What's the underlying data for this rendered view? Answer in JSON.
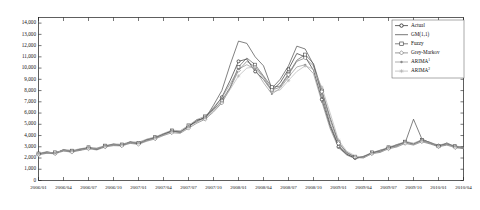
{
  "chart_data": {
    "type": "line",
    "title": "",
    "xlabel": "",
    "ylabel": "",
    "ylim": [
      0,
      14500
    ],
    "yticks": [
      0,
      1000,
      2000,
      3000,
      4000,
      5000,
      6000,
      7000,
      8000,
      9000,
      10000,
      11000,
      12000,
      13000,
      14000
    ],
    "ytick_labels": [
      "0",
      "1,000",
      "2,000",
      "3,000",
      "4,000",
      "5,000",
      "6,000",
      "7,000",
      "8,000",
      "9,000",
      "10,000",
      "11,000",
      "12,000",
      "13,000",
      "14,000"
    ],
    "grid": false,
    "legend_position": "top-right",
    "x_tick_labels": [
      "2006/01",
      "2006/04",
      "2006/07",
      "2006/10",
      "2007/01",
      "2007/04",
      "2007/07",
      "2007/10",
      "2008/01",
      "2008/04",
      "2008/07",
      "2008/10",
      "2009/01",
      "2009/04",
      "2009/07",
      "2009/10",
      "2010/01",
      "2010/04"
    ],
    "x_months": [
      "2006/01",
      "2006/02",
      "2006/03",
      "2006/04",
      "2006/05",
      "2006/06",
      "2006/07",
      "2006/08",
      "2006/09",
      "2006/10",
      "2006/11",
      "2006/12",
      "2007/01",
      "2007/02",
      "2007/03",
      "2007/04",
      "2007/05",
      "2007/06",
      "2007/07",
      "2007/08",
      "2007/09",
      "2007/10",
      "2007/11",
      "2007/12",
      "2008/01",
      "2008/02",
      "2008/03",
      "2008/04",
      "2008/05",
      "2008/06",
      "2008/07",
      "2008/08",
      "2008/09",
      "2008/10",
      "2008/11",
      "2008/12",
      "2009/01",
      "2009/02",
      "2009/03",
      "2009/04",
      "2009/05",
      "2009/06",
      "2009/07",
      "2009/08",
      "2009/09",
      "2009/10",
      "2009/11",
      "2009/12",
      "2010/01",
      "2010/02",
      "2010/03",
      "2010/04"
    ],
    "series": [
      {
        "name": "Actual",
        "color": "#222222",
        "marker": "circle-filled",
        "values": [
          2350,
          2500,
          2450,
          2700,
          2600,
          2750,
          2900,
          2800,
          3050,
          3200,
          3150,
          3400,
          3300,
          3600,
          3800,
          4100,
          4400,
          4300,
          4800,
          5300,
          5600,
          6400,
          7400,
          8900,
          10600,
          10800,
          9700,
          9000,
          8000,
          8700,
          9900,
          11300,
          11000,
          9800,
          7200,
          4800,
          3000,
          2300,
          2000,
          2100,
          2450,
          2600,
          2900,
          3100,
          3400,
          3250,
          3550,
          3300,
          3100,
          3250,
          3000,
          2900
        ]
      },
      {
        "name": "GM(1,1)",
        "color": "#3d3d3d",
        "marker": "none",
        "values": [
          2300,
          2550,
          2400,
          2750,
          2550,
          2800,
          2850,
          2850,
          3000,
          3250,
          3100,
          3450,
          3250,
          3650,
          3750,
          4150,
          4350,
          4350,
          4750,
          5400,
          5500,
          6700,
          8000,
          10300,
          12400,
          12200,
          11000,
          10200,
          8200,
          9000,
          10200,
          11950,
          11700,
          10300,
          7600,
          5000,
          3100,
          2350,
          1950,
          2150,
          2400,
          2700,
          2850,
          3200,
          3350,
          5450,
          3700,
          3350,
          3000,
          3350,
          2950,
          3000
        ]
      },
      {
        "name": "Fuzzy",
        "color": "#4f4f4f",
        "marker": "square",
        "values": [
          2400,
          2450,
          2500,
          2650,
          2650,
          2700,
          2950,
          2750,
          3100,
          3150,
          3200,
          3350,
          3350,
          3550,
          3850,
          4050,
          4450,
          4250,
          4900,
          5200,
          5700,
          6300,
          7100,
          8300,
          10100,
          10900,
          10300,
          9300,
          8300,
          8400,
          9500,
          10700,
          11200,
          10400,
          8000,
          5600,
          3400,
          2500,
          2100,
          2050,
          2500,
          2550,
          2950,
          3050,
          3450,
          3200,
          3600,
          3400,
          3050,
          3200,
          3050,
          2850
        ]
      },
      {
        "name": "Grey-Markov",
        "color": "#6e6e6e",
        "marker": "diamond",
        "values": [
          2280,
          2420,
          2380,
          2620,
          2520,
          2680,
          2820,
          2720,
          2980,
          3100,
          3080,
          3300,
          3220,
          3500,
          3700,
          4000,
          4250,
          4200,
          4650,
          5100,
          5450,
          6100,
          6900,
          8200,
          9800,
          10600,
          10100,
          9200,
          8050,
          8300,
          9400,
          10600,
          10900,
          10200,
          7900,
          5400,
          3300,
          2450,
          2050,
          2000,
          2380,
          2500,
          2820,
          2980,
          3300,
          3150,
          3450,
          3250,
          3000,
          3150,
          2920,
          2830
        ]
      },
      {
        "name": "ARIMA1",
        "color": "#8a8a8a",
        "marker": "dot",
        "values": [
          2420,
          2560,
          2420,
          2760,
          2680,
          2820,
          2960,
          2880,
          3120,
          3250,
          3220,
          3450,
          3400,
          3680,
          3880,
          4180,
          4480,
          4420,
          4900,
          5420,
          5720,
          6500,
          7350,
          8600,
          9900,
          10300,
          9900,
          8700,
          7700,
          8200,
          9200,
          10100,
          10300,
          9500,
          7000,
          4600,
          2900,
          2250,
          1950,
          2150,
          2500,
          2680,
          2980,
          3180,
          3480,
          3320,
          3620,
          3380,
          3150,
          3300,
          3080,
          2950
        ]
      },
      {
        "name": "ARIMA2",
        "color": "#b0b0b0",
        "marker": "star",
        "values": [
          2330,
          2480,
          2480,
          2680,
          2620,
          2720,
          2880,
          2820,
          3020,
          3180,
          3180,
          3370,
          3330,
          3570,
          3760,
          4070,
          4320,
          4300,
          4730,
          5230,
          5530,
          6200,
          7000,
          8100,
          9300,
          10000,
          10100,
          9000,
          7900,
          8050,
          8900,
          9700,
          10200,
          9900,
          8300,
          6000,
          3600,
          2600,
          2200,
          2050,
          2400,
          2560,
          2870,
          3060,
          3380,
          3200,
          3520,
          3310,
          3050,
          3200,
          3000,
          2880
        ]
      }
    ]
  },
  "legend": {
    "entries": [
      {
        "label": "Actual"
      },
      {
        "label": "GM(1,1)"
      },
      {
        "label": "Fuzzy"
      },
      {
        "label": "Grey-Markov"
      },
      {
        "label": "ARIMA",
        "sup": "1"
      },
      {
        "label": "ARIMA",
        "sup": "2"
      }
    ]
  }
}
